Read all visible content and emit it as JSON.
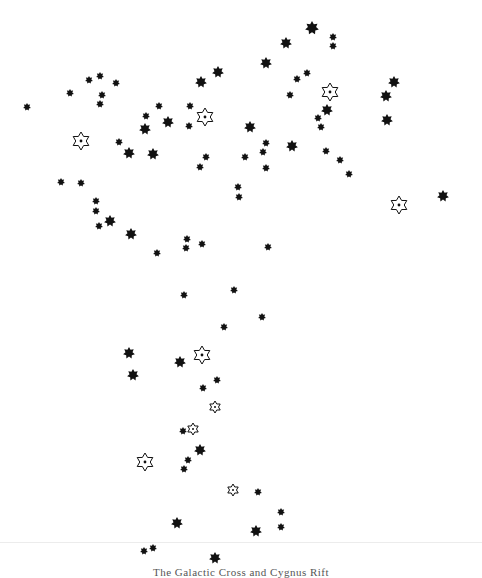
{
  "figure": {
    "caption": "The Galactic Cross and Cygnus Rift",
    "background": "#ffffff",
    "star_color": "#111111",
    "legend_note": "filled six/eight-point stars = stars; open six-point stars with central dot = marked stars"
  },
  "stars": [
    {
      "x": 312,
      "y": 28,
      "r": 7,
      "type": "filled"
    },
    {
      "x": 333,
      "y": 37,
      "r": 4,
      "type": "filled"
    },
    {
      "x": 333,
      "y": 46,
      "r": 4,
      "type": "filled"
    },
    {
      "x": 286,
      "y": 43,
      "r": 6,
      "type": "filled"
    },
    {
      "x": 266,
      "y": 63,
      "r": 6,
      "type": "filled"
    },
    {
      "x": 218,
      "y": 72,
      "r": 6,
      "type": "filled"
    },
    {
      "x": 201,
      "y": 82,
      "r": 6,
      "type": "filled"
    },
    {
      "x": 307,
      "y": 73,
      "r": 4,
      "type": "filled"
    },
    {
      "x": 297,
      "y": 79,
      "r": 4,
      "type": "filled"
    },
    {
      "x": 290,
      "y": 95,
      "r": 4,
      "type": "filled"
    },
    {
      "x": 330,
      "y": 92,
      "r": 9,
      "type": "open"
    },
    {
      "x": 394,
      "y": 82,
      "r": 6,
      "type": "filled"
    },
    {
      "x": 386,
      "y": 96,
      "r": 6,
      "type": "filled"
    },
    {
      "x": 387,
      "y": 120,
      "r": 6,
      "type": "filled"
    },
    {
      "x": 327,
      "y": 110,
      "r": 6,
      "type": "filled"
    },
    {
      "x": 27,
      "y": 107,
      "r": 4,
      "type": "filled"
    },
    {
      "x": 70,
      "y": 93,
      "r": 4,
      "type": "filled"
    },
    {
      "x": 89,
      "y": 80,
      "r": 4,
      "type": "filled"
    },
    {
      "x": 100,
      "y": 76,
      "r": 4,
      "type": "filled"
    },
    {
      "x": 116,
      "y": 83,
      "r": 4,
      "type": "filled"
    },
    {
      "x": 102,
      "y": 95,
      "r": 4,
      "type": "filled"
    },
    {
      "x": 100,
      "y": 104,
      "r": 4,
      "type": "filled"
    },
    {
      "x": 81,
      "y": 141,
      "r": 9,
      "type": "open"
    },
    {
      "x": 159,
      "y": 106,
      "r": 4,
      "type": "filled"
    },
    {
      "x": 190,
      "y": 106,
      "r": 4,
      "type": "filled"
    },
    {
      "x": 205,
      "y": 117,
      "r": 9,
      "type": "open"
    },
    {
      "x": 189,
      "y": 126,
      "r": 4,
      "type": "filled"
    },
    {
      "x": 146,
      "y": 116,
      "r": 4,
      "type": "filled"
    },
    {
      "x": 145,
      "y": 129,
      "r": 6,
      "type": "filled"
    },
    {
      "x": 168,
      "y": 122,
      "r": 6,
      "type": "filled"
    },
    {
      "x": 119,
      "y": 142,
      "r": 4,
      "type": "filled"
    },
    {
      "x": 129,
      "y": 153,
      "r": 6,
      "type": "filled"
    },
    {
      "x": 153,
      "y": 154,
      "r": 6,
      "type": "filled"
    },
    {
      "x": 250,
      "y": 127,
      "r": 6,
      "type": "filled"
    },
    {
      "x": 266,
      "y": 143,
      "r": 4,
      "type": "filled"
    },
    {
      "x": 263,
      "y": 152,
      "r": 4,
      "type": "filled"
    },
    {
      "x": 245,
      "y": 157,
      "r": 4,
      "type": "filled"
    },
    {
      "x": 266,
      "y": 168,
      "r": 4,
      "type": "filled"
    },
    {
      "x": 292,
      "y": 146,
      "r": 6,
      "type": "filled"
    },
    {
      "x": 318,
      "y": 118,
      "r": 4,
      "type": "filled"
    },
    {
      "x": 321,
      "y": 127,
      "r": 4,
      "type": "filled"
    },
    {
      "x": 326,
      "y": 151,
      "r": 4,
      "type": "filled"
    },
    {
      "x": 340,
      "y": 160,
      "r": 4,
      "type": "filled"
    },
    {
      "x": 349,
      "y": 174,
      "r": 4,
      "type": "filled"
    },
    {
      "x": 206,
      "y": 157,
      "r": 4,
      "type": "filled"
    },
    {
      "x": 200,
      "y": 167,
      "r": 4,
      "type": "filled"
    },
    {
      "x": 238,
      "y": 187,
      "r": 4,
      "type": "filled"
    },
    {
      "x": 239,
      "y": 197,
      "r": 4,
      "type": "filled"
    },
    {
      "x": 399,
      "y": 205,
      "r": 9,
      "type": "open"
    },
    {
      "x": 443,
      "y": 196,
      "r": 6,
      "type": "filled"
    },
    {
      "x": 61,
      "y": 182,
      "r": 4,
      "type": "filled"
    },
    {
      "x": 81,
      "y": 183,
      "r": 4,
      "type": "filled"
    },
    {
      "x": 96,
      "y": 201,
      "r": 4,
      "type": "filled"
    },
    {
      "x": 96,
      "y": 211,
      "r": 4,
      "type": "filled"
    },
    {
      "x": 110,
      "y": 221,
      "r": 6,
      "type": "filled"
    },
    {
      "x": 99,
      "y": 226,
      "r": 4,
      "type": "filled"
    },
    {
      "x": 131,
      "y": 234,
      "r": 6,
      "type": "filled"
    },
    {
      "x": 157,
      "y": 253,
      "r": 4,
      "type": "filled"
    },
    {
      "x": 187,
      "y": 239,
      "r": 4,
      "type": "filled"
    },
    {
      "x": 186,
      "y": 248,
      "r": 4,
      "type": "filled"
    },
    {
      "x": 202,
      "y": 244,
      "r": 4,
      "type": "filled"
    },
    {
      "x": 268,
      "y": 247,
      "r": 4,
      "type": "filled"
    },
    {
      "x": 184,
      "y": 295,
      "r": 4,
      "type": "filled"
    },
    {
      "x": 234,
      "y": 290,
      "r": 4,
      "type": "filled"
    },
    {
      "x": 262,
      "y": 317,
      "r": 4,
      "type": "filled"
    },
    {
      "x": 224,
      "y": 327,
      "r": 4,
      "type": "filled"
    },
    {
      "x": 129,
      "y": 353,
      "r": 6,
      "type": "filled"
    },
    {
      "x": 133,
      "y": 375,
      "r": 6,
      "type": "filled"
    },
    {
      "x": 180,
      "y": 362,
      "r": 6,
      "type": "filled"
    },
    {
      "x": 202,
      "y": 355,
      "r": 9,
      "type": "open"
    },
    {
      "x": 217,
      "y": 380,
      "r": 4,
      "type": "filled"
    },
    {
      "x": 203,
      "y": 388,
      "r": 4,
      "type": "filled"
    },
    {
      "x": 215,
      "y": 407,
      "r": 6,
      "type": "open"
    },
    {
      "x": 193,
      "y": 429,
      "r": 6,
      "type": "open"
    },
    {
      "x": 183,
      "y": 431,
      "r": 4,
      "type": "filled"
    },
    {
      "x": 200,
      "y": 450,
      "r": 6,
      "type": "filled"
    },
    {
      "x": 188,
      "y": 460,
      "r": 4,
      "type": "filled"
    },
    {
      "x": 184,
      "y": 469,
      "r": 4,
      "type": "filled"
    },
    {
      "x": 145,
      "y": 462,
      "r": 9,
      "type": "open"
    },
    {
      "x": 233,
      "y": 490,
      "r": 6,
      "type": "open"
    },
    {
      "x": 258,
      "y": 492,
      "r": 4,
      "type": "filled"
    },
    {
      "x": 177,
      "y": 523,
      "r": 6,
      "type": "filled"
    },
    {
      "x": 256,
      "y": 531,
      "r": 6,
      "type": "filled"
    },
    {
      "x": 281,
      "y": 512,
      "r": 4,
      "type": "filled"
    },
    {
      "x": 281,
      "y": 527,
      "r": 4,
      "type": "filled"
    },
    {
      "x": 144,
      "y": 551,
      "r": 4,
      "type": "filled"
    },
    {
      "x": 153,
      "y": 548,
      "r": 4,
      "type": "filled"
    },
    {
      "x": 215,
      "y": 558,
      "r": 6,
      "type": "filled"
    }
  ]
}
